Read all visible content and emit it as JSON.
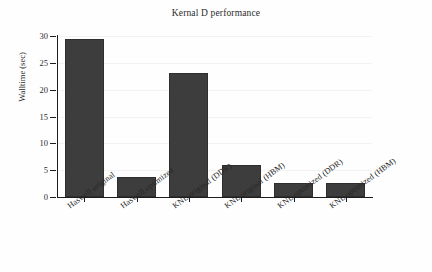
{
  "chart_data": {
    "type": "bar",
    "title": "Kernal D performance",
    "xlabel": "",
    "ylabel": "Walltime (sec)",
    "categories": [
      "Haswell original",
      "Haswell optimized",
      "KNL original (DDR)",
      "KNL original (HBM)",
      "KNL optimized (DDR)",
      "KNL optimized (HBM)"
    ],
    "values": [
      29.4,
      3.7,
      23.2,
      6.05,
      2.7,
      2.6
    ],
    "ylim": [
      0,
      30
    ],
    "yticks": [
      0,
      5,
      10,
      15,
      20,
      25,
      30
    ],
    "ytick_labels": [
      "0",
      "5",
      "10",
      "15",
      "20",
      "25",
      "30"
    ],
    "grid": true,
    "legend": false,
    "bar_color": "#3d3d3d",
    "background_color": "#ffffff",
    "axis_color": "#1d1d1d",
    "gridline_color": "#f2f2f2"
  }
}
